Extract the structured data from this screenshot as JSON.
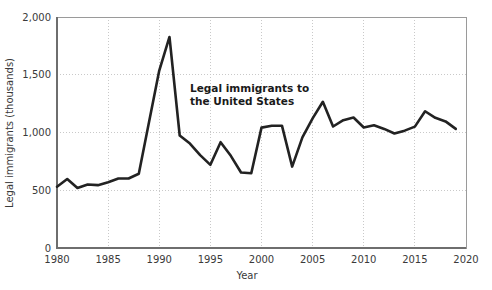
{
  "chart_data": {
    "type": "line",
    "title": "",
    "xlabel": "Year",
    "ylabel": "Legal immigrants (thousands)",
    "xlim": [
      1980,
      2020
    ],
    "ylim": [
      0,
      2000
    ],
    "grid": true,
    "legend": "none",
    "annotations": [
      {
        "name": "series-label",
        "line1": "Legal immigrants to",
        "line2": "the United States",
        "x": 1992.5,
        "y": 1400
      }
    ],
    "x_tick_labels": [
      "1980",
      "1985",
      "1990",
      "1995",
      "2000",
      "2005",
      "2010",
      "2015",
      "2020"
    ],
    "x_ticks": [
      1980,
      1985,
      1990,
      1995,
      2000,
      2005,
      2010,
      2015,
      2020
    ],
    "y_tick_labels": [
      "0",
      "500",
      "1,000",
      "1,500",
      "2,000"
    ],
    "y_ticks": [
      0,
      500,
      1000,
      1500,
      2000
    ],
    "series": [
      {
        "name": "Legal immigrants to the United States",
        "color": "#222222",
        "x": [
          1980,
          1981,
          1982,
          1983,
          1984,
          1985,
          1986,
          1987,
          1988,
          1989,
          1990,
          1991,
          1992,
          1993,
          1994,
          1995,
          1996,
          1997,
          1998,
          1999,
          2000,
          2001,
          2002,
          2003,
          2004,
          2005,
          2006,
          2007,
          2008,
          2009,
          2010,
          2011,
          2012,
          2013,
          2014,
          2015,
          2016,
          2017,
          2018,
          2019
        ],
        "values": [
          531,
          597,
          519,
          550,
          544,
          570,
          602,
          602,
          643,
          1091,
          1536,
          1827,
          974,
          904,
          804,
          720,
          916,
          798,
          654,
          647,
          1042,
          1059,
          1059,
          705,
          958,
          1122,
          1266,
          1052,
          1107,
          1130,
          1043,
          1062,
          1031,
          991,
          1016,
          1051,
          1184,
          1127,
          1096,
          1031
        ]
      }
    ]
  },
  "axes": {
    "plot_left_px": 57,
    "plot_right_px": 466,
    "plot_top_px": 17,
    "plot_bottom_px": 248
  }
}
